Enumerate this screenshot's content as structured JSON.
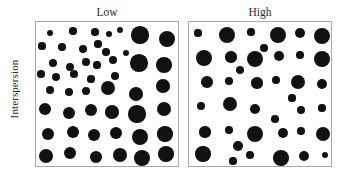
{
  "axis": {
    "ylabel": "Interspersion"
  },
  "panels": [
    {
      "key": "low",
      "title": "Low"
    },
    {
      "key": "high",
      "title": "High"
    }
  ],
  "style": {
    "dot_color": "#111111",
    "border_color": "#a8a8a8",
    "text_color": "#2b2b2b",
    "background": "#ffffff"
  },
  "chart_data": {
    "type": "scatter",
    "title": "",
    "subtitle": "",
    "xlabel": "",
    "ylabel": "Interspersion",
    "grid": false,
    "legend": null,
    "panel_layout": "1 row x 2 columns",
    "xlim": [
      0,
      144
    ],
    "ylim": [
      0,
      146
    ],
    "series": [
      {
        "name": "Low",
        "panel": "low",
        "n_points": 48,
        "radius_range": [
          3.0,
          9.5
        ],
        "points": [
          {
            "x": 14,
            "y": 11,
            "r": 3.4
          },
          {
            "x": 37,
            "y": 9,
            "r": 3.6
          },
          {
            "x": 59,
            "y": 10,
            "r": 3.8
          },
          {
            "x": 73,
            "y": 12,
            "r": 3.2
          },
          {
            "x": 84,
            "y": 8,
            "r": 3.4
          },
          {
            "x": 104,
            "y": 13,
            "r": 8.6
          },
          {
            "x": 131,
            "y": 17,
            "r": 8.2
          },
          {
            "x": 6,
            "y": 24,
            "r": 3.6
          },
          {
            "x": 26,
            "y": 25,
            "r": 3.8
          },
          {
            "x": 47,
            "y": 27,
            "r": 4.0
          },
          {
            "x": 62,
            "y": 22,
            "r": 3.6
          },
          {
            "x": 70,
            "y": 30,
            "r": 3.8
          },
          {
            "x": 90,
            "y": 31,
            "r": 3.4
          },
          {
            "x": 17,
            "y": 41,
            "r": 4.0
          },
          {
            "x": 34,
            "y": 45,
            "r": 4.2
          },
          {
            "x": 50,
            "y": 40,
            "r": 3.8
          },
          {
            "x": 61,
            "y": 43,
            "r": 3.6
          },
          {
            "x": 77,
            "y": 38,
            "r": 4.0
          },
          {
            "x": 103,
            "y": 41,
            "r": 8.8
          },
          {
            "x": 128,
            "y": 43,
            "r": 7.8
          },
          {
            "x": 5,
            "y": 52,
            "r": 3.6
          },
          {
            "x": 20,
            "y": 55,
            "r": 4.0
          },
          {
            "x": 38,
            "y": 52,
            "r": 3.8
          },
          {
            "x": 55,
            "y": 57,
            "r": 3.6
          },
          {
            "x": 79,
            "y": 54,
            "r": 4.2
          },
          {
            "x": 14,
            "y": 68,
            "r": 4.2
          },
          {
            "x": 33,
            "y": 70,
            "r": 4.4
          },
          {
            "x": 50,
            "y": 69,
            "r": 4.2
          },
          {
            "x": 72,
            "y": 66,
            "r": 7.4
          },
          {
            "x": 100,
            "y": 72,
            "r": 7.0
          },
          {
            "x": 127,
            "y": 64,
            "r": 6.8
          },
          {
            "x": 9,
            "y": 87,
            "r": 6.4
          },
          {
            "x": 33,
            "y": 91,
            "r": 6.2
          },
          {
            "x": 55,
            "y": 88,
            "r": 6.0
          },
          {
            "x": 76,
            "y": 90,
            "r": 6.6
          },
          {
            "x": 101,
            "y": 92,
            "r": 8.6
          },
          {
            "x": 128,
            "y": 87,
            "r": 7.2
          },
          {
            "x": 12,
            "y": 112,
            "r": 6.0
          },
          {
            "x": 37,
            "y": 110,
            "r": 6.2
          },
          {
            "x": 58,
            "y": 113,
            "r": 6.4
          },
          {
            "x": 80,
            "y": 111,
            "r": 6.2
          },
          {
            "x": 104,
            "y": 115,
            "r": 8.0
          },
          {
            "x": 129,
            "y": 112,
            "r": 7.6
          },
          {
            "x": 10,
            "y": 134,
            "r": 7.0
          },
          {
            "x": 34,
            "y": 131,
            "r": 6.2
          },
          {
            "x": 60,
            "y": 135,
            "r": 6.4
          },
          {
            "x": 84,
            "y": 133,
            "r": 6.8
          },
          {
            "x": 106,
            "y": 136,
            "r": 8.2
          },
          {
            "x": 130,
            "y": 132,
            "r": 7.8
          }
        ]
      },
      {
        "name": "High",
        "panel": "high",
        "n_points": 44,
        "radius_range": [
          3.0,
          9.5
        ],
        "points": [
          {
            "x": 9,
            "y": 11,
            "r": 3.6
          },
          {
            "x": 38,
            "y": 13,
            "r": 8.4
          },
          {
            "x": 62,
            "y": 10,
            "r": 3.6
          },
          {
            "x": 89,
            "y": 13,
            "r": 8.2
          },
          {
            "x": 111,
            "y": 11,
            "r": 5.2
          },
          {
            "x": 133,
            "y": 14,
            "r": 8.0
          },
          {
            "x": 75,
            "y": 26,
            "r": 4.0
          },
          {
            "x": 15,
            "y": 36,
            "r": 8.4
          },
          {
            "x": 42,
            "y": 35,
            "r": 5.6
          },
          {
            "x": 66,
            "y": 37,
            "r": 8.0
          },
          {
            "x": 90,
            "y": 34,
            "r": 5.4
          },
          {
            "x": 111,
            "y": 33,
            "r": 3.8
          },
          {
            "x": 133,
            "y": 37,
            "r": 8.2
          },
          {
            "x": 51,
            "y": 48,
            "r": 4.2
          },
          {
            "x": 18,
            "y": 60,
            "r": 5.8
          },
          {
            "x": 40,
            "y": 59,
            "r": 3.8
          },
          {
            "x": 68,
            "y": 61,
            "r": 5.6
          },
          {
            "x": 87,
            "y": 58,
            "r": 3.8
          },
          {
            "x": 109,
            "y": 60,
            "r": 7.4
          },
          {
            "x": 133,
            "y": 62,
            "r": 5.2
          },
          {
            "x": 103,
            "y": 76,
            "r": 3.6
          },
          {
            "x": 12,
            "y": 84,
            "r": 3.8
          },
          {
            "x": 41,
            "y": 82,
            "r": 7.2
          },
          {
            "x": 66,
            "y": 87,
            "r": 5.0
          },
          {
            "x": 112,
            "y": 88,
            "r": 4.4
          },
          {
            "x": 133,
            "y": 86,
            "r": 3.6
          },
          {
            "x": 86,
            "y": 97,
            "r": 3.8
          },
          {
            "x": 16,
            "y": 110,
            "r": 5.6
          },
          {
            "x": 40,
            "y": 108,
            "r": 3.8
          },
          {
            "x": 66,
            "y": 112,
            "r": 8.0
          },
          {
            "x": 94,
            "y": 111,
            "r": 5.4
          },
          {
            "x": 112,
            "y": 109,
            "r": 3.8
          },
          {
            "x": 134,
            "y": 112,
            "r": 7.0
          },
          {
            "x": 49,
            "y": 124,
            "r": 4.8
          },
          {
            "x": 14,
            "y": 132,
            "r": 7.6
          },
          {
            "x": 44,
            "y": 139,
            "r": 3.6
          },
          {
            "x": 61,
            "y": 133,
            "r": 3.8
          },
          {
            "x": 92,
            "y": 136,
            "r": 7.8
          },
          {
            "x": 115,
            "y": 134,
            "r": 5.0
          },
          {
            "x": 136,
            "y": 133,
            "r": 3.4
          }
        ]
      }
    ]
  }
}
